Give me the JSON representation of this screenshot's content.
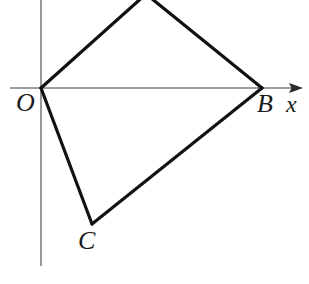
{
  "figure": {
    "type": "geometry-diagram",
    "width": 309,
    "height": 284,
    "background_color": "#ffffff",
    "shape_stroke_color": "#111111",
    "shape_stroke_width": 3.2,
    "axis_stroke_color": "#7d7d85",
    "axis_stroke_width": 1.6,
    "axes": {
      "x_axis": {
        "label": "x",
        "start_x": 10,
        "end_x": 303,
        "y": 88,
        "has_arrow": true,
        "arrow_tip_x": 303
      },
      "y_axis": {
        "label": "",
        "x": 41,
        "start_y": 0,
        "end_y": 266,
        "has_arrow": false
      }
    },
    "vertices": [
      {
        "name": "O",
        "label": "O",
        "x": 41,
        "y": 88,
        "label_x": 16,
        "label_y": 90,
        "on_axis": true
      },
      {
        "name": "A",
        "label": "",
        "x": 146,
        "y": -6,
        "label_x": 0,
        "label_y": 0,
        "on_axis": false
      },
      {
        "name": "B",
        "label": "B",
        "x": 262,
        "y": 88,
        "label_x": 257,
        "label_y": 91,
        "on_axis": true
      },
      {
        "name": "C",
        "label": "C",
        "x": 92,
        "y": 224,
        "label_x": 78,
        "label_y": 228,
        "on_axis": false
      }
    ],
    "edges": [
      {
        "name": "edge-OA",
        "from": "O",
        "to": "A"
      },
      {
        "name": "edge-AB",
        "from": "A",
        "to": "B"
      },
      {
        "name": "edge-BC",
        "from": "B",
        "to": "C"
      },
      {
        "name": "edge-CO",
        "from": "C",
        "to": "O"
      }
    ],
    "polygon_points": "41,88 146,-6 262,88 92,224",
    "labels": {
      "origin": "O",
      "vertex_b": "B",
      "vertex_c": "C",
      "x_axis": "x"
    }
  }
}
